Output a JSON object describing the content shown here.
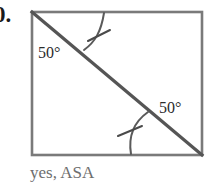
{
  "exercise": {
    "number_label": "0."
  },
  "figure": {
    "name": "square-with-diagonal",
    "colors": {
      "square_stroke": "#7a7a7a",
      "diagonal_stroke": "#555555",
      "arc_stroke": "#5a5a5a",
      "tick_stroke": "#4a4a4a",
      "label_text": "#2b2b2b",
      "caption_text": "#6e6e6e",
      "background": "#ffffff"
    },
    "square": {
      "left": 32,
      "top": 12,
      "right": 202,
      "bottom": 155
    },
    "diagonal": {
      "from": [
        32,
        12
      ],
      "to": [
        202,
        155
      ]
    },
    "angles": [
      {
        "name": "angle-top-left",
        "value": "50°",
        "vertex": "top-left",
        "marks": 1
      },
      {
        "name": "angle-bottom-right",
        "value": "50°",
        "vertex": "bottom-right",
        "marks": 1
      }
    ]
  },
  "labels": {
    "angle_top": "50°",
    "angle_bottom": "50°"
  },
  "caption": {
    "answer_text": "yes, ASA"
  }
}
